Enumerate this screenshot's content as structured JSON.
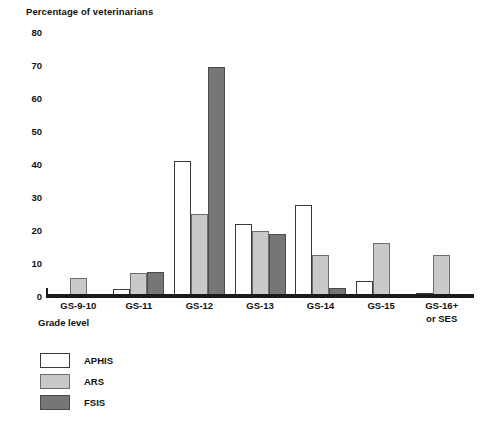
{
  "chart_data": {
    "type": "bar",
    "title": "",
    "ylabel": "Percentage of veterinarians",
    "xlabel": "Grade level",
    "ylim": [
      0,
      80
    ],
    "yticks": [
      0,
      10,
      20,
      30,
      40,
      50,
      60,
      70,
      80
    ],
    "grid": false,
    "legend_position": "bottom-left",
    "categories": [
      "GS-9-10",
      "GS-11",
      "GS-12",
      "GS-13",
      "GS-14",
      "GS-15",
      "GS-16+\nor SES"
    ],
    "series": [
      {
        "name": "APHIS",
        "color": "#ffffff",
        "values": [
          0,
          2.0,
          41.0,
          21.8,
          27.5,
          4.5,
          0.8
        ]
      },
      {
        "name": "ARS",
        "color": "#c9c9c9",
        "values": [
          5.5,
          7.0,
          25.0,
          19.8,
          12.5,
          16.0,
          12.3
        ]
      },
      {
        "name": "FSIS",
        "color": "#767676",
        "values": [
          0,
          7.3,
          69.5,
          18.8,
          2.3,
          0.4,
          0.2
        ]
      }
    ]
  },
  "legend": {
    "items": [
      {
        "label": "APHIS"
      },
      {
        "label": "ARS"
      },
      {
        "label": "FSIS"
      }
    ]
  }
}
